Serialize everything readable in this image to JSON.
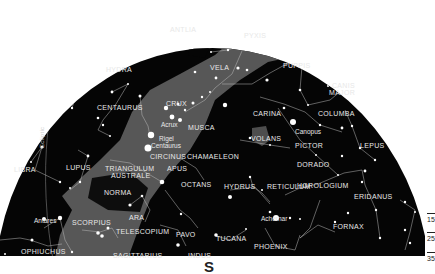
{
  "map": {
    "type": "star-chart",
    "hemisphere": "southern sky half-dome",
    "cardinal_direction": "S",
    "colors": {
      "sky": "#050505",
      "milky_way": "#5a5a5a",
      "stars": "#ffffff",
      "lines": "#bdbdbd",
      "labels": "#e8e8e8",
      "background": "#ffffff"
    },
    "ecliptic_label": "Ecliptic",
    "constellations": [
      {
        "name": "ANTLIA",
        "x": 170,
        "y": 26
      },
      {
        "name": "PYXIS",
        "x": 244,
        "y": 32
      },
      {
        "name": "HYDRA",
        "x": 106,
        "y": 66
      },
      {
        "name": "VELA",
        "x": 210,
        "y": 64
      },
      {
        "name": "PUPPIS",
        "x": 283,
        "y": 62
      },
      {
        "name": "CANIS",
        "x": 332,
        "y": 82
      },
      {
        "name": "MAJOR",
        "x": 329,
        "y": 89
      },
      {
        "name": "CENTAURUS",
        "x": 97,
        "y": 104
      },
      {
        "name": "CRUX",
        "x": 166,
        "y": 100
      },
      {
        "name": "CARINA",
        "x": 253,
        "y": 110
      },
      {
        "name": "COLUMBA",
        "x": 318,
        "y": 110
      },
      {
        "name": "MUSCA",
        "x": 188,
        "y": 124
      },
      {
        "name": "CIRCINUS",
        "x": 150,
        "y": 153
      },
      {
        "name": "CHAMAELEON",
        "x": 187,
        "y": 153
      },
      {
        "name": "PICTOR",
        "x": 295,
        "y": 142
      },
      {
        "name": "LEPUS",
        "x": 360,
        "y": 142
      },
      {
        "name": "VOLANS",
        "x": 251,
        "y": 135
      },
      {
        "name": "LIBRA",
        "x": 14,
        "y": 166
      },
      {
        "name": "LUPUS",
        "x": 66,
        "y": 164
      },
      {
        "name": "TRIANGULUM",
        "x": 105,
        "y": 165
      },
      {
        "name": "AUSTRALE",
        "x": 111,
        "y": 172
      },
      {
        "name": "APUS",
        "x": 167,
        "y": 165
      },
      {
        "name": "OCTANS",
        "x": 181,
        "y": 181
      },
      {
        "name": "DORADO",
        "x": 297,
        "y": 161
      },
      {
        "name": "HYDRUS",
        "x": 224,
        "y": 183
      },
      {
        "name": "RETICULUM",
        "x": 267,
        "y": 183
      },
      {
        "name": "HOROLOGIUM",
        "x": 297,
        "y": 182
      },
      {
        "name": "ERIDANUS",
        "x": 354,
        "y": 193
      },
      {
        "name": "NORMA",
        "x": 104,
        "y": 189
      },
      {
        "name": "ARA",
        "x": 129,
        "y": 214
      },
      {
        "name": "FORNAX",
        "x": 333,
        "y": 223
      },
      {
        "name": "SCORPIUS",
        "x": 72,
        "y": 219
      },
      {
        "name": "TELESCOPIUM",
        "x": 116,
        "y": 228
      },
      {
        "name": "PAVO",
        "x": 176,
        "y": 231
      },
      {
        "name": "TUCANA",
        "x": 216,
        "y": 235
      },
      {
        "name": "PHOENIX",
        "x": 254,
        "y": 243
      },
      {
        "name": "OPHIUCHUS",
        "x": 21,
        "y": 248
      },
      {
        "name": "SAGITTARIUS",
        "x": 113,
        "y": 252
      },
      {
        "name": "INDUS",
        "x": 188,
        "y": 252
      }
    ],
    "named_stars": [
      {
        "name": "Acrux",
        "x": 161,
        "y": 121
      },
      {
        "name": "Rigel",
        "x": 159,
        "y": 135
      },
      {
        "name": "Centaurus",
        "x": 151,
        "y": 142
      },
      {
        "name": "Canopus",
        "x": 295,
        "y": 128
      },
      {
        "name": "Antares",
        "x": 34,
        "y": 217
      },
      {
        "name": "Achernar",
        "x": 261,
        "y": 215
      }
    ],
    "scale": {
      "labels": [
        "15",
        "25",
        "35"
      ]
    }
  }
}
